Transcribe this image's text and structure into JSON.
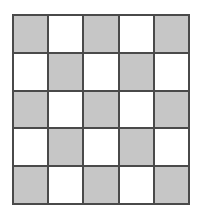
{
  "figure": {
    "name": "checkerboard-pattern",
    "rows": 5,
    "columns": 5,
    "shaded_count": 13,
    "unshaded_count": 12,
    "colors": {
      "shaded_fill": "#c6c6c6",
      "unshaded_fill": "#ffffff",
      "grid_line": "#4a4a4a",
      "background": "#ffffff"
    },
    "cells": [
      [
        {
          "state": "shaded"
        },
        {
          "state": "unshaded"
        },
        {
          "state": "shaded"
        },
        {
          "state": "unshaded"
        },
        {
          "state": "shaded"
        }
      ],
      [
        {
          "state": "unshaded"
        },
        {
          "state": "shaded"
        },
        {
          "state": "unshaded"
        },
        {
          "state": "shaded"
        },
        {
          "state": "unshaded"
        }
      ],
      [
        {
          "state": "shaded"
        },
        {
          "state": "unshaded"
        },
        {
          "state": "shaded"
        },
        {
          "state": "unshaded"
        },
        {
          "state": "shaded"
        }
      ],
      [
        {
          "state": "unshaded"
        },
        {
          "state": "shaded"
        },
        {
          "state": "unshaded"
        },
        {
          "state": "shaded"
        },
        {
          "state": "unshaded"
        }
      ],
      [
        {
          "state": "shaded"
        },
        {
          "state": "unshaded"
        },
        {
          "state": "shaded"
        },
        {
          "state": "unshaded"
        },
        {
          "state": "shaded"
        }
      ]
    ]
  }
}
